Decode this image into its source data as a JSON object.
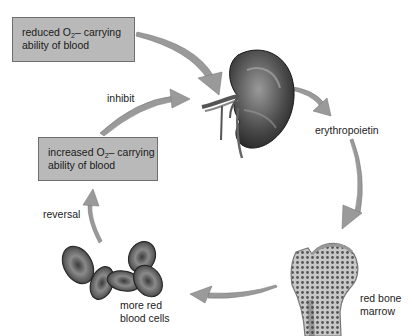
{
  "diagram": {
    "type": "cycle",
    "boxes": [
      {
        "id": "reduced",
        "line1_pre": "reduced O",
        "line1_sub": "2",
        "line1_post": "– carrying",
        "line2": "ability of blood"
      },
      {
        "id": "increased",
        "line1_pre": "increased O",
        "line1_sub": "2",
        "line1_post": "– carrying",
        "line2": "ability of blood"
      }
    ],
    "labels": {
      "inhibit": "inhibit",
      "erythropoietin": "erythropoietin",
      "red_bone_marrow_1": "red bone",
      "red_bone_marrow_2": "marrow",
      "more_rbc_1": "more red",
      "more_rbc_2": "blood cells",
      "reversal": "reversal"
    },
    "illustrations": [
      "kidney",
      "bone (femur head)",
      "red blood cells"
    ],
    "colors": {
      "box_fill": "#b9b9b9",
      "box_border": "#6e6e6e",
      "arrow": "#9a9a9a"
    }
  }
}
